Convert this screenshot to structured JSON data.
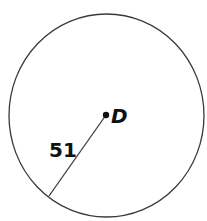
{
  "diagram": {
    "type": "circle-with-radius",
    "center_label": "D",
    "radius_label": "51",
    "colors": {
      "stroke": "#3a3a3a",
      "text": "#111111",
      "background": "#ffffff"
    }
  }
}
